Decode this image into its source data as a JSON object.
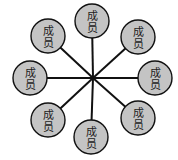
{
  "diagram": {
    "type": "star-network",
    "center": {
      "x": 93,
      "y": 78
    },
    "node_radius": 17,
    "colors": {
      "node_fill": "#c4c4c4",
      "stroke": "#111111",
      "text": "#222222",
      "background": "#ffffff"
    },
    "nodes": [
      {
        "label_line1": "成",
        "label_line2": "员",
        "x": 92,
        "y": 21
      },
      {
        "label_line1": "成",
        "label_line2": "员",
        "x": 138,
        "y": 37
      },
      {
        "label_line1": "成",
        "label_line2": "员",
        "x": 155,
        "y": 78
      },
      {
        "label_line1": "成",
        "label_line2": "员",
        "x": 138,
        "y": 118
      },
      {
        "label_line1": "成",
        "label_line2": "员",
        "x": 91,
        "y": 137
      },
      {
        "label_line1": "成",
        "label_line2": "员",
        "x": 48,
        "y": 120
      },
      {
        "label_line1": "成",
        "label_line2": "员",
        "x": 30,
        "y": 78
      },
      {
        "label_line1": "成",
        "label_line2": "员",
        "x": 48,
        "y": 36
      }
    ]
  }
}
